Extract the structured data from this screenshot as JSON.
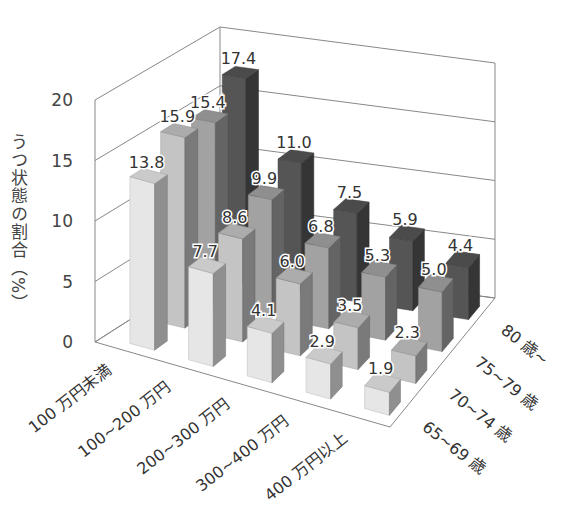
{
  "chart_data": {
    "type": "bar",
    "subtype": "3d-grouped",
    "title": "",
    "ylabel": "うつ状態の割合（%）",
    "xlabel": "",
    "ylim": [
      0,
      20
    ],
    "yticks": [
      "0",
      "5",
      "10",
      "15",
      "20"
    ],
    "grid": true,
    "categories": [
      "100万円未満",
      "100~200万円",
      "200~300万円",
      "300~400万円",
      "400万円以上"
    ],
    "category_labels": [
      "100 万円未満",
      "100~200 万円",
      "200~300 万円",
      "300~400 万円",
      "400 万円以上"
    ],
    "series": [
      {
        "name": "65~69 歳",
        "values": [
          13.8,
          7.7,
          4.1,
          2.9,
          1.9
        ],
        "color": "#e6e6e6"
      },
      {
        "name": "70~74 歳",
        "values": [
          15.9,
          8.6,
          6.0,
          3.5,
          2.3
        ],
        "color": "#c4c4c4"
      },
      {
        "name": "75~79 歳",
        "values": [
          15.4,
          9.9,
          6.8,
          5.3,
          5.0
        ],
        "color": "#a2a2a2"
      },
      {
        "name": "80 歳~",
        "values": [
          17.4,
          11.0,
          7.5,
          5.9,
          4.4
        ],
        "color": "#555555"
      }
    ],
    "value_labels": [
      [
        "13.8",
        "7.7",
        "4.1",
        "2.9",
        "1.9"
      ],
      [
        "15.9",
        "8.6",
        "6.0",
        "3.5",
        "2.3"
      ],
      [
        "15.4",
        "9.9",
        "6.8",
        "5.3",
        "5.0"
      ],
      [
        "17.4",
        "11.0",
        "7.5",
        "5.9",
        "4.4"
      ]
    ]
  }
}
